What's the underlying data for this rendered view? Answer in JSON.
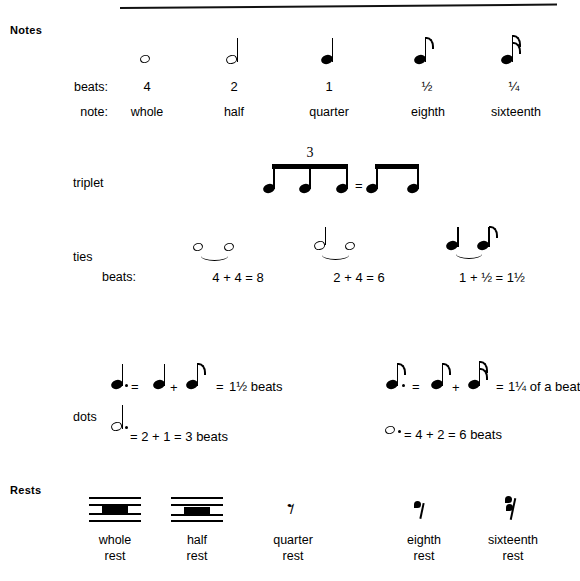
{
  "document": {
    "title": "Notes and Rests Reference Chart",
    "ink_color": "#000000",
    "background_color": "#ffffff"
  },
  "sections": {
    "notes_header": "Notes",
    "rests_header": "Rests"
  },
  "notes_table": {
    "row_labels": {
      "beats": "beats:",
      "note": "note:"
    },
    "columns": [
      {
        "glyph": "whole-note",
        "beats": "4",
        "name": "whole"
      },
      {
        "glyph": "half-note",
        "beats": "2",
        "name": "half"
      },
      {
        "glyph": "quarter-note",
        "beats": "1",
        "name": "quarter"
      },
      {
        "glyph": "eighth-note",
        "beats": "½",
        "name": "eighth"
      },
      {
        "glyph": "sixteenth-note",
        "beats": "¼",
        "name": "sixteenth"
      }
    ]
  },
  "triplet": {
    "label": "triplet",
    "number": "3",
    "equals": "=",
    "left_group": "three-beamed-eighth-notes",
    "right_group": "two-beamed-eighth-notes"
  },
  "ties": {
    "label": "ties",
    "beats_label": "beats:",
    "examples": [
      {
        "notes": "whole-tied-whole",
        "equation": "4 + 4 = 8"
      },
      {
        "notes": "half-tied-whole",
        "equation": "2 + 4 = 6"
      },
      {
        "notes": "quarter-tied-eighth",
        "equation": "1 + ½ = 1½"
      }
    ]
  },
  "dots": {
    "label": "dots",
    "left_column": [
      {
        "dotted_note": "dotted-quarter-note",
        "eq1": "=",
        "addend1": "quarter-note",
        "plus": "+",
        "addend2": "eighth-note",
        "eq2": "=",
        "result": "1½ beats"
      },
      {
        "dotted_note": "dotted-half-note",
        "text": "= 2 + 1 = 3 beats"
      }
    ],
    "right_column": [
      {
        "dotted_note": "dotted-eighth-note",
        "eq1": "=",
        "addend1": "eighth-note",
        "plus": "+",
        "addend2": "sixteenth-note",
        "eq2": "=",
        "result": "1¼ of a beat"
      },
      {
        "dotted_note": "dotted-whole-note",
        "text": "= 4 + 2 = 6 beats"
      }
    ]
  },
  "rests_table": {
    "columns": [
      {
        "glyph": "whole-rest",
        "line1": "whole",
        "line2": "rest"
      },
      {
        "glyph": "half-rest",
        "line1": "half",
        "line2": "rest"
      },
      {
        "glyph": "quarter-rest",
        "line1": "quarter",
        "line2": "rest"
      },
      {
        "glyph": "eighth-rest",
        "line1": "eighth",
        "line2": "rest"
      },
      {
        "glyph": "sixteenth-rest",
        "line1": "sixteenth",
        "line2": "rest"
      }
    ]
  }
}
